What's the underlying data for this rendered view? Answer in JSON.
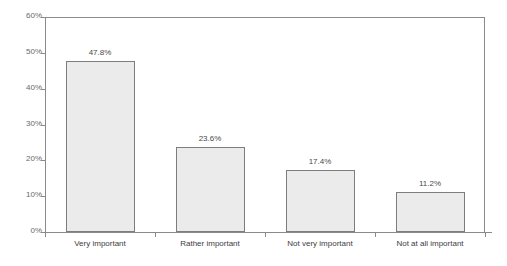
{
  "chart_data": {
    "type": "bar",
    "title": "",
    "subtitle": "",
    "xlabel": "",
    "ylabel": "",
    "categories": [
      "Very important",
      "Rather important",
      "Not very important",
      "Not at all important"
    ],
    "values": [
      47.8,
      23.6,
      17.4,
      11.2
    ],
    "data_labels": [
      "47.8%",
      "23.6%",
      "17.4%",
      "11.2%"
    ],
    "ylim": [
      0,
      60
    ],
    "ytick_values": [
      0,
      10,
      20,
      30,
      40,
      50,
      60
    ],
    "ytick_labels": [
      "0%",
      "10%",
      "20%",
      "30%",
      "40%",
      "50%",
      "60%"
    ],
    "grid": false,
    "legend": false,
    "legend_position": "none",
    "series": [
      {
        "name": "",
        "values": [
          47.8,
          23.6,
          17.4,
          11.2
        ]
      }
    ],
    "annotations": [],
    "colors": {
      "bar_fill": "#ebebeb",
      "bar_border": "#7d7d7d",
      "axis_line": "#8a8a8a",
      "tick_label": "#6a6a6a",
      "category_label": "#3d3d3d",
      "value_label": "#4a4a4a",
      "background": "#ffffff"
    }
  }
}
